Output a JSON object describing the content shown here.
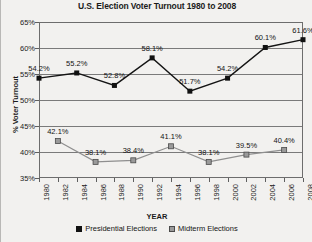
{
  "chart_data": {
    "type": "line",
    "title": "U.S. Election Voter Turnout 1980 to 2008",
    "xlabel": "YEAR",
    "ylabel": "% Voter Turnout",
    "ylim": [
      35,
      65
    ],
    "ytick_labels": [
      "35%",
      "40%",
      "45%",
      "50%",
      "55%",
      "60%",
      "65%"
    ],
    "ytick_values": [
      35,
      40,
      45,
      50,
      55,
      60,
      65
    ],
    "xlim": [
      1980,
      2008
    ],
    "xtick_labels": [
      "1980",
      "1982",
      "1984",
      "1986",
      "1988",
      "1990",
      "1992",
      "1994",
      "1996",
      "1998",
      "2000",
      "2002",
      "2004",
      "2006",
      "2008"
    ],
    "grid": true,
    "legend_position": "bottom",
    "series": [
      {
        "name": "Presidential Elections",
        "color": "#111111",
        "marker": "filled-square",
        "x": [
          1980,
          1984,
          1988,
          1992,
          1996,
          2000,
          2004,
          2008
        ],
        "values": [
          54.2,
          55.2,
          52.8,
          58.1,
          51.7,
          54.2,
          60.1,
          61.6
        ],
        "data_labels": [
          "54.2%",
          "55.2%",
          "52.8%",
          "58.1%",
          "51.7%",
          "54.2%",
          "60.1%",
          "61.6%"
        ]
      },
      {
        "name": "Midterm Elections",
        "color": "#9a9a9a",
        "marker": "gray-square",
        "x": [
          1982,
          1986,
          1990,
          1994,
          1998,
          2002,
          2006
        ],
        "values": [
          42.1,
          38.1,
          38.4,
          41.1,
          38.1,
          39.5,
          40.4
        ],
        "data_labels": [
          "42.1%",
          "38.1%",
          "38.4%",
          "41.1%",
          "38.1%",
          "39.5%",
          "40.4%"
        ]
      }
    ]
  },
  "legend": {
    "entries": [
      {
        "label": "Presidential Elections"
      },
      {
        "label": "Midterm Elections"
      }
    ]
  }
}
